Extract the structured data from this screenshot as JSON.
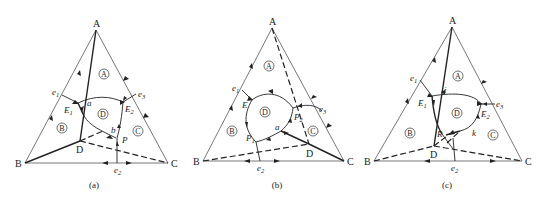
{
  "panels": [
    {
      "caption": "(a)",
      "vertices": {
        "A": "A",
        "B": "B",
        "C": "C"
      },
      "compound": "D",
      "regions": [
        "A",
        "B",
        "C",
        "D"
      ],
      "eutectic_binary": [
        "e1",
        "e2",
        "e3"
      ],
      "points": {
        "E1": "E",
        "E1_sub": "1",
        "E2": "E",
        "E2_sub": "2",
        "a": "a",
        "b": "b",
        "P": "P"
      }
    },
    {
      "caption": "(b)",
      "vertices": {
        "A": "A",
        "B": "B",
        "C": "C"
      },
      "compound": "D",
      "regions": [
        "A",
        "B",
        "C",
        "D"
      ],
      "eutectic_binary": [
        "e1",
        "e2",
        "e3"
      ],
      "points": {
        "E": "E",
        "P1": "P",
        "P1_sub": "1",
        "P2": "P",
        "P2_sub": "2",
        "a": "a"
      }
    },
    {
      "caption": "(c)",
      "vertices": {
        "A": "A",
        "B": "B",
        "C": "C"
      },
      "compound": "D",
      "regions": [
        "A",
        "B",
        "C",
        "D"
      ],
      "eutectic_binary": [
        "e1",
        "e2",
        "e3"
      ],
      "points": {
        "E1": "E",
        "E1_sub": "1",
        "E2": "E",
        "E2_sub": "2",
        "i": "i",
        "k": "k",
        "R": "R"
      }
    }
  ],
  "labels": {
    "e": "e",
    "sub1": "1",
    "sub2": "2",
    "sub3": "3"
  }
}
